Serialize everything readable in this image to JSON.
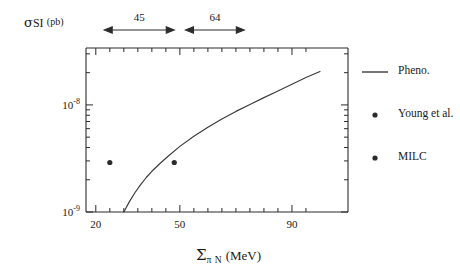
{
  "figure": {
    "background": "#ffffff",
    "ink": "#222222"
  },
  "axes": {
    "x_label_symbol": "Σ",
    "x_label_sub": "π N",
    "x_label_unit": "(MeV)",
    "y_label_symbol": "σ",
    "y_label_sub": "SI",
    "y_label_unit": "(pb)",
    "x_ticks": [
      {
        "value": 20,
        "label": "20",
        "major": true
      },
      {
        "value": 25,
        "label": "",
        "major": false
      },
      {
        "value": 30,
        "label": "",
        "major": false
      },
      {
        "value": 35,
        "label": "",
        "major": false
      },
      {
        "value": 40,
        "label": "",
        "major": false
      },
      {
        "value": 45,
        "label": "",
        "major": false
      },
      {
        "value": 50,
        "label": "50",
        "major": true
      },
      {
        "value": 55,
        "label": "",
        "major": false
      },
      {
        "value": 60,
        "label": "",
        "major": false
      },
      {
        "value": 65,
        "label": "",
        "major": false
      },
      {
        "value": 70,
        "label": "",
        "major": false
      },
      {
        "value": 75,
        "label": "",
        "major": false
      },
      {
        "value": 80,
        "label": "",
        "major": false
      },
      {
        "value": 85,
        "label": "",
        "major": false
      },
      {
        "value": 90,
        "label": "90",
        "major": true
      },
      {
        "value": 95,
        "label": "",
        "major": false
      }
    ],
    "y_ticks": [
      {
        "value": 1e-08,
        "mantissa": "10",
        "exponent": "-8",
        "major": true
      },
      {
        "value": 1e-09,
        "mantissa": "10",
        "exponent": "-9",
        "major": true
      }
    ],
    "xlim": [
      16.5,
      110
    ],
    "ylim": [
      1e-09,
      3.4e-08
    ],
    "y_scale": "log",
    "x_scale": "linear",
    "grid": false
  },
  "annotations": [
    {
      "name": "sigma-45-arrow",
      "label": "45",
      "x_start": 23,
      "x_end": 48
    },
    {
      "name": "sigma-64-arrow",
      "label": "64",
      "x_start": 52,
      "x_end": 73
    }
  ],
  "legend": {
    "position": "right",
    "entries": [
      {
        "label": "Pheno.",
        "marker": "line",
        "color": "#2b2b2b"
      },
      {
        "label": "Young et al.",
        "marker": "dot",
        "color": "#2b2b2b"
      },
      {
        "label": "MILC",
        "marker": "dot",
        "color": "#2b2b2b"
      }
    ]
  },
  "chart_data": {
    "type": "line",
    "title": "",
    "subtitle": "",
    "xlabel": "Σ_{πN} (MeV)",
    "ylabel": "σ_{SI} (pb)",
    "xlim": [
      16.5,
      110
    ],
    "ylim": [
      1e-09,
      3.4e-08
    ],
    "y_scale": "log",
    "grid": false,
    "legend_position": "right",
    "series": [
      {
        "name": "Pheno.",
        "type": "line",
        "color": "#2b2b2b",
        "x": [
          30.0,
          32.0,
          34.0,
          36.0,
          38.0,
          40.0,
          43.0,
          46.0,
          50.0,
          55.0,
          60.0,
          65.0,
          70.0,
          75.0,
          80.0,
          85.0,
          90.0,
          95.0,
          100.0
        ],
        "y": [
          1e-09,
          1.25e-09,
          1.52e-09,
          1.8e-09,
          2.1e-09,
          2.4e-09,
          2.85e-09,
          3.35e-09,
          4.1e-09,
          5.1e-09,
          6.2e-09,
          7.4e-09,
          8.7e-09,
          1.01e-08,
          1.17e-08,
          1.35e-08,
          1.56e-08,
          1.8e-08,
          2.05e-08
        ]
      },
      {
        "name": "Young et al.",
        "type": "scatter",
        "color": "#2b2b2b",
        "x": [
          25.0
        ],
        "y": [
          2.9e-09
        ]
      },
      {
        "name": "MILC",
        "type": "scatter",
        "color": "#2b2b2b",
        "x": [
          48.0
        ],
        "y": [
          2.9e-09
        ]
      }
    ],
    "annotations": [
      {
        "text": "45",
        "x_range": [
          23,
          48
        ],
        "kind": "double-arrow"
      },
      {
        "text": "64",
        "x_range": [
          52,
          73
        ],
        "kind": "double-arrow"
      }
    ]
  }
}
